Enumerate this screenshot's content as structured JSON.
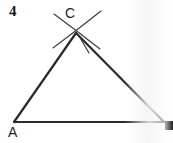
{
  "figure": {
    "problem_number": "4",
    "background_color": "#ffffff",
    "ink_color": "#2a2a2a",
    "labels": [
      {
        "name": "problem-number",
        "text": "4",
        "x": 9,
        "y": 4
      },
      {
        "name": "vertex-label-c",
        "text": "C",
        "x": 65,
        "y": 6
      },
      {
        "name": "vertex-label-a",
        "text": "A",
        "x": 8,
        "y": 125
      }
    ],
    "vertices": {
      "a": {
        "label": "A",
        "x": 14,
        "y": 122
      },
      "b": {
        "label": "",
        "x": 164,
        "y": 122
      },
      "c": {
        "label": "C",
        "x": 76,
        "y": 33
      }
    },
    "segments": [
      {
        "name": "side-ac",
        "x1": 14,
        "y1": 122,
        "x2": 76,
        "y2": 33
      },
      {
        "name": "side-cb",
        "x1": 76,
        "y1": 33,
        "x2": 164,
        "y2": 122
      },
      {
        "name": "side-ab-base",
        "x1": 14,
        "y1": 122,
        "x2": 164,
        "y2": 122
      }
    ],
    "construction_arcs": [
      {
        "name": "arc-left",
        "from_x": 54,
        "from_y": 14,
        "to_x": 100,
        "to_y": 49
      },
      {
        "name": "arc-right",
        "from_x": 101,
        "from_y": 11,
        "to_x": 53,
        "to_y": 48
      }
    ],
    "arrow_marker": {
      "name": "arrowhead-on-cb",
      "tip_x": 79,
      "tip_y": 36,
      "barb_x": 89,
      "barb_y": 53
    },
    "edge_artifact": {
      "name": "scan-edge-mark",
      "x": 165,
      "y": 121,
      "width": 8,
      "height": 9,
      "color": "#1c1c1c"
    }
  }
}
